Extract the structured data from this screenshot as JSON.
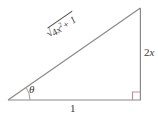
{
  "figure": {
    "type": "right-triangle-diagram",
    "background_color": "#ffffff",
    "stroke_color": "#8a8a8a",
    "accent_color": "#c48a99",
    "text_color": "#3a3a3a",
    "vertices": {
      "bottom_left": {
        "x": 8,
        "y": 100
      },
      "bottom_right": {
        "x": 141,
        "y": 100
      },
      "top_right": {
        "x": 141,
        "y": 8
      }
    },
    "labels": {
      "hypotenuse": {
        "radical_symbol": "√",
        "radicand_coefficient": "4",
        "radicand_variable": "x",
        "radicand_exponent": "2",
        "radicand_plus": "+ 1",
        "full_text": "√(4x² + 1)",
        "rotation_deg": -34.7
      },
      "vertical_side": {
        "coefficient": "2",
        "variable": "x",
        "full_text": "2x"
      },
      "horizontal_side": {
        "full_text": "1"
      },
      "angle": {
        "symbol": "θ",
        "full_text": "θ"
      }
    },
    "markers": {
      "right_angle": {
        "name": "right-angle-square",
        "color": "#c48a99",
        "size": 8
      },
      "angle_arc": {
        "name": "theta-arc",
        "color": "#8a8a8a",
        "radius": 22
      }
    }
  }
}
